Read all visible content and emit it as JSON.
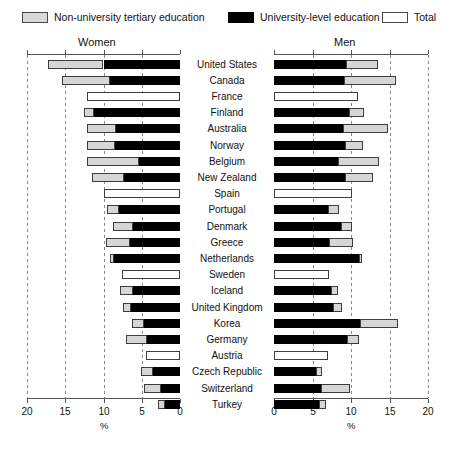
{
  "legend": {
    "items": [
      {
        "label": "Non-university tertiary education",
        "swatch": "gray-swatch-icon",
        "color": "#d9d9d9"
      },
      {
        "label": "University-level education",
        "swatch": "black-swatch-icon",
        "color": "#000000"
      },
      {
        "label": "Total",
        "swatch": "white-swatch-icon",
        "color": "#ffffff"
      }
    ]
  },
  "panels": {
    "left_title": "Women",
    "right_title": "Men"
  },
  "axis": {
    "unit": "%",
    "left_ticks": [
      "20",
      "15",
      "10",
      "5",
      "0"
    ],
    "right_ticks": [
      "0",
      "5",
      "10",
      "15",
      "20"
    ],
    "limit": 20,
    "tick_step": 5
  },
  "chart_data": {
    "type": "bar",
    "title": "",
    "subtitle": "",
    "xlabel": "%",
    "ylabel": "",
    "xlim": [
      0,
      20
    ],
    "grid": true,
    "legend_position": "top",
    "orientation": "horizontal",
    "layout": "mirrored-pyramid",
    "panels": [
      "Women",
      "Men"
    ],
    "series": [
      {
        "name": "Non-university tertiary education",
        "color": "#d9d9d9"
      },
      {
        "name": "University-level education",
        "color": "#000000"
      },
      {
        "name": "Total",
        "color": "#ffffff"
      }
    ],
    "categories": [
      "United States",
      "Canada",
      "France",
      "Finland",
      "Australia",
      "Norway",
      "Belgium",
      "New Zealand",
      "Spain",
      "Portugal",
      "Denmark",
      "Greece",
      "Netherlands",
      "Sweden",
      "Iceland",
      "United Kingdom",
      "Korea",
      "Germany",
      "Austria",
      "Czech Republic",
      "Switzerland",
      "Turkey"
    ],
    "rows": [
      {
        "country": "United States",
        "women": {
          "non_university": 7.2,
          "university": 10.0,
          "total": null
        },
        "men": {
          "non_university": 4.1,
          "university": 9.4,
          "total": null
        }
      },
      {
        "country": "Canada",
        "women": {
          "non_university": 6.3,
          "university": 9.1,
          "total": null
        },
        "men": {
          "non_university": 6.7,
          "university": 9.1,
          "total": null
        }
      },
      {
        "country": "France",
        "women": {
          "non_university": null,
          "university": null,
          "total": 12.2
        },
        "men": {
          "non_university": null,
          "university": null,
          "total": 10.9
        }
      },
      {
        "country": "Finland",
        "women": {
          "non_university": 1.2,
          "university": 11.3,
          "total": null
        },
        "men": {
          "non_university": 1.9,
          "university": 9.8,
          "total": null
        }
      },
      {
        "country": "Australia",
        "women": {
          "non_university": 3.8,
          "university": 8.4,
          "total": null
        },
        "men": {
          "non_university": 5.8,
          "university": 9.0,
          "total": null
        }
      },
      {
        "country": "Norway",
        "women": {
          "non_university": 3.7,
          "university": 8.5,
          "total": null
        },
        "men": {
          "non_university": 2.3,
          "university": 9.2,
          "total": null
        }
      },
      {
        "country": "Belgium",
        "women": {
          "non_university": 6.8,
          "university": 5.4,
          "total": null
        },
        "men": {
          "non_university": 5.3,
          "university": 8.3,
          "total": null
        }
      },
      {
        "country": "New Zealand",
        "women": {
          "non_university": 4.2,
          "university": 7.3,
          "total": null
        },
        "men": {
          "non_university": 3.6,
          "university": 9.2,
          "total": null
        }
      },
      {
        "country": "Spain",
        "women": {
          "non_university": null,
          "university": null,
          "total": 9.9
        },
        "men": {
          "non_university": null,
          "university": null,
          "total": 10.1
        }
      },
      {
        "country": "Portugal",
        "women": {
          "non_university": 1.6,
          "university": 8.0,
          "total": null
        },
        "men": {
          "non_university": 1.5,
          "university": 7.0,
          "total": null
        }
      },
      {
        "country": "Denmark",
        "women": {
          "non_university": 2.5,
          "university": 6.2,
          "total": null
        },
        "men": {
          "non_university": 1.4,
          "university": 8.7,
          "total": null
        }
      },
      {
        "country": "Greece",
        "women": {
          "non_university": 3.2,
          "university": 6.5,
          "total": null
        },
        "men": {
          "non_university": 3.1,
          "university": 7.1,
          "total": null
        }
      },
      {
        "country": "Netherlands",
        "women": {
          "non_university": 0.6,
          "university": 8.6,
          "total": null
        },
        "men": {
          "non_university": 0.4,
          "university": 11.0,
          "total": null
        }
      },
      {
        "country": "Sweden",
        "women": {
          "non_university": null,
          "university": null,
          "total": 7.6
        },
        "men": {
          "non_university": null,
          "university": null,
          "total": 7.2
        }
      },
      {
        "country": "Iceland",
        "women": {
          "non_university": 1.7,
          "university": 6.2,
          "total": null
        },
        "men": {
          "non_university": 0.9,
          "university": 7.4,
          "total": null
        }
      },
      {
        "country": "United Kingdom",
        "women": {
          "non_university": 1.0,
          "university": 6.4,
          "total": null
        },
        "men": {
          "non_university": 1.2,
          "university": 7.6,
          "total": null
        }
      },
      {
        "country": "Korea",
        "women": {
          "non_university": 1.6,
          "university": 4.7,
          "total": null
        },
        "men": {
          "non_university": 4.9,
          "university": 11.2,
          "total": null
        }
      },
      {
        "country": "Germany",
        "women": {
          "non_university": 2.8,
          "university": 4.3,
          "total": null
        },
        "men": {
          "non_university": 1.5,
          "university": 9.5,
          "total": null
        }
      },
      {
        "country": "Austria",
        "women": {
          "non_university": null,
          "university": null,
          "total": 4.4
        },
        "men": {
          "non_university": null,
          "university": null,
          "total": 7.0
        }
      },
      {
        "country": "Czech Republic",
        "women": {
          "non_university": 1.6,
          "university": 3.5,
          "total": null
        },
        "men": {
          "non_university": 0.7,
          "university": 5.5,
          "total": null
        }
      },
      {
        "country": "Switzerland",
        "women": {
          "non_university": 2.2,
          "university": 2.5,
          "total": null
        },
        "men": {
          "non_university": 3.8,
          "university": 6.1,
          "total": null
        }
      },
      {
        "country": "Turkey",
        "women": {
          "non_university": 0.9,
          "university": 2.0,
          "total": null
        },
        "men": {
          "non_university": 0.9,
          "university": 5.9,
          "total": null
        }
      }
    ]
  }
}
